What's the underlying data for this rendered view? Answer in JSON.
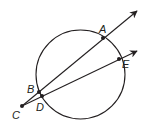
{
  "diagram": {
    "type": "geometry-secants",
    "stroke_color": "#231f20",
    "background": "#ffffff",
    "circle": {
      "cx": 80.5,
      "cy": 74.5,
      "r": 44.5
    },
    "points": {
      "A": {
        "x": 103,
        "y": 38,
        "label": "A",
        "lx": 99,
        "ly": 33
      },
      "E": {
        "x": 119,
        "y": 59,
        "label": "E",
        "lx": 122,
        "ly": 68
      },
      "B": {
        "x": 39,
        "y": 92,
        "label": "B",
        "lx": 27,
        "ly": 93
      },
      "D": {
        "x": 42,
        "y": 96,
        "label": "D",
        "lx": 36,
        "ly": 111
      },
      "C": {
        "x": 22,
        "y": 106,
        "label": "C",
        "lx": 12,
        "ly": 119
      }
    },
    "rays": [
      {
        "name": "ray-CA",
        "from": "C",
        "through": "A",
        "tip": {
          "x": 137,
          "y": 11
        }
      },
      {
        "name": "ray-CE",
        "from": "C",
        "through": "E",
        "tip": {
          "x": 137,
          "y": 51
        }
      }
    ]
  }
}
